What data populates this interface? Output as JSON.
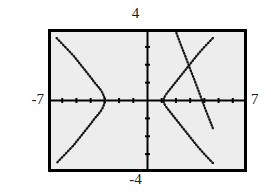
{
  "figure": {
    "name": "graphing-calculator-viewport",
    "background_color": "#ffffff",
    "screen_fill": "#ededed",
    "frame_color": "#000000",
    "curve_color": "#111111"
  },
  "labels": {
    "top": "4",
    "bottom": "-4",
    "left": "-7",
    "right": "7"
  },
  "chart_data": {
    "type": "line",
    "title": "",
    "xlabel": "",
    "ylabel": "",
    "xlim": [
      -7,
      7
    ],
    "ylim": [
      -4,
      4
    ],
    "grid": false,
    "legend": "none",
    "axes": {
      "x_axis_at_y": 0,
      "y_axis_at_x": 0,
      "x_tick_step": 1,
      "y_tick_step": 1,
      "tick_style": "short-marks-on-axes"
    },
    "tick_labels": {
      "x": [
        "-7",
        "7"
      ],
      "y": [
        "-4",
        "4"
      ]
    },
    "render_style": "dotted-pixel-trace",
    "series": [
      {
        "name": "left-opening-parabola",
        "kind": "parabola",
        "opens": "left",
        "vertex": [
          -3.0,
          0.0
        ],
        "points": [
          [
            -6.4,
            3.5
          ],
          [
            -6.1,
            3.25
          ],
          [
            -5.8,
            3.0
          ],
          [
            -5.5,
            2.75
          ],
          [
            -5.2,
            2.5
          ],
          [
            -4.95,
            2.25
          ],
          [
            -4.7,
            2.0
          ],
          [
            -4.45,
            1.75
          ],
          [
            -4.2,
            1.5
          ],
          [
            -3.95,
            1.25
          ],
          [
            -3.72,
            1.0
          ],
          [
            -3.5,
            0.8
          ],
          [
            -3.3,
            0.6
          ],
          [
            -3.15,
            0.4
          ],
          [
            -3.05,
            0.2
          ],
          [
            -3.0,
            0.0
          ],
          [
            -3.05,
            -0.2
          ],
          [
            -3.15,
            -0.4
          ],
          [
            -3.3,
            -0.6
          ],
          [
            -3.5,
            -0.8
          ],
          [
            -3.72,
            -1.0
          ],
          [
            -3.95,
            -1.25
          ],
          [
            -4.2,
            -1.5
          ],
          [
            -4.45,
            -1.75
          ],
          [
            -4.7,
            -2.0
          ],
          [
            -4.95,
            -2.25
          ],
          [
            -5.2,
            -2.5
          ],
          [
            -5.5,
            -2.75
          ],
          [
            -5.8,
            -3.0
          ],
          [
            -6.1,
            -3.25
          ],
          [
            -6.4,
            -3.5
          ]
        ]
      },
      {
        "name": "right-opening-parabola",
        "kind": "parabola",
        "opens": "right",
        "vertex": [
          1.1,
          0.0
        ],
        "points": [
          [
            4.6,
            3.5
          ],
          [
            4.3,
            3.25
          ],
          [
            4.0,
            3.0
          ],
          [
            3.72,
            2.75
          ],
          [
            3.45,
            2.5
          ],
          [
            3.2,
            2.25
          ],
          [
            2.95,
            2.0
          ],
          [
            2.7,
            1.75
          ],
          [
            2.45,
            1.5
          ],
          [
            2.2,
            1.25
          ],
          [
            2.0,
            1.05
          ],
          [
            1.8,
            0.85
          ],
          [
            1.6,
            0.65
          ],
          [
            1.4,
            0.45
          ],
          [
            1.22,
            0.25
          ],
          [
            1.1,
            0.0
          ],
          [
            1.22,
            -0.25
          ],
          [
            1.4,
            -0.45
          ],
          [
            1.6,
            -0.65
          ],
          [
            1.8,
            -0.85
          ],
          [
            2.0,
            -1.05
          ],
          [
            2.2,
            -1.25
          ],
          [
            2.45,
            -1.5
          ],
          [
            2.7,
            -1.75
          ],
          [
            2.95,
            -2.0
          ],
          [
            3.2,
            -2.25
          ],
          [
            3.45,
            -2.5
          ],
          [
            3.72,
            -2.75
          ],
          [
            4.0,
            -3.0
          ],
          [
            4.3,
            -3.25
          ],
          [
            4.6,
            -3.5
          ]
        ]
      },
      {
        "name": "descending-line",
        "kind": "line",
        "slope": -2.1,
        "points": [
          [
            1.95,
            3.95
          ],
          [
            2.3,
            3.2
          ],
          [
            2.65,
            2.5
          ],
          [
            3.0,
            1.75
          ],
          [
            3.35,
            1.05
          ],
          [
            3.7,
            0.3
          ],
          [
            4.05,
            -0.45
          ],
          [
            4.4,
            -1.15
          ],
          [
            4.62,
            -1.6
          ]
        ]
      }
    ]
  }
}
